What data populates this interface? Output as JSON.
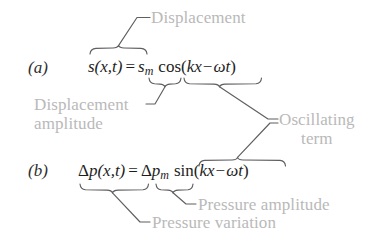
{
  "figure": {
    "text_color": "#1d1d1d",
    "label_color": "#b9b9b9",
    "line_color": "#6e6e6e",
    "background": "#ffffff"
  },
  "panels": [
    {
      "id": "a",
      "label": "(a)",
      "equation_plain": "s(x,t) = s_m cos(kx - ωt)",
      "terms": {
        "left_side": "s(x,t)",
        "equals": "=",
        "amplitude": "s",
        "amplitude_subscript": "m",
        "function": "cos",
        "open_paren": "(",
        "phase_first": "kx",
        "minus": "−",
        "phase_second": "ωt",
        "close_paren": ")"
      }
    },
    {
      "id": "b",
      "label": "(b)",
      "equation_plain": "Δp(x,t) = Δp_m sin(kx - ωt)",
      "terms": {
        "delta": "Δ",
        "left_side": "p(x,t)",
        "equals": "=",
        "amplitude_delta": "Δ",
        "amplitude": "p",
        "amplitude_subscript": "m",
        "function": "sin",
        "open_paren": "(",
        "phase_first": "kx",
        "minus": "−",
        "phase_second": "ωt",
        "close_paren": ")"
      }
    }
  ],
  "annotations": [
    {
      "id": "displacement",
      "text": "Displacement",
      "lines": [],
      "points_to": "s(x,t)"
    },
    {
      "id": "displacement-amplitude",
      "text_line_1": "Displacement",
      "text_line_2": "amplitude",
      "points_to": "s_m"
    },
    {
      "id": "oscillating-term",
      "text_line_1": "Oscillating",
      "text_line_2": "term",
      "points_to": "cos(kx - ωt) and sin(kx - ωt)"
    },
    {
      "id": "pressure-amplitude",
      "text": "Pressure amplitude",
      "points_to": "Δp_m"
    },
    {
      "id": "pressure-variation",
      "text": "Pressure variation",
      "points_to": "Δp(x,t)"
    }
  ]
}
